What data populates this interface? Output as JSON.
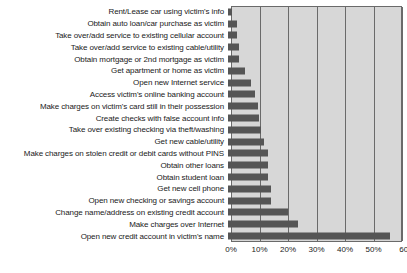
{
  "chart_data": {
    "type": "bar",
    "orientation": "horizontal",
    "title": "",
    "subtitle": "",
    "xlabel": "",
    "ylabel": "",
    "xlim": [
      0,
      60
    ],
    "grid": true,
    "legend": null,
    "bar_color": "#555555",
    "plot_background": "#d7d7d7",
    "axis_color": "#6a6a6a",
    "tick_labels": [
      "0%",
      "10%",
      "20%",
      "30%",
      "40%",
      "50%",
      "60"
    ],
    "tick_values": [
      0,
      10,
      20,
      30,
      40,
      50,
      60
    ],
    "categories": [
      "Rent/Lease car using victim's info",
      "Obtain auto loan/car purchase as victim",
      "Take over/add service to existing cellular account",
      "Take over/add service to existing cable/utility",
      "Obtain mortgage or 2nd mortgage as victim",
      "Get apartment or home as victim",
      "Open new Internet service",
      "Access victim's online banking account",
      "Make charges on victim's card still in their possession",
      "Create checks with false account info",
      "Take over existing checking via theft/washing",
      "Get new cable/utility",
      "Make charges on stolen credit or debit cards without PINS",
      "Obtain other loans",
      "Obtain student loan",
      "Get new cell phone",
      "Open new checking or savings account",
      "Change name/address on existing credit account",
      "Make charges over Internet",
      "Open new credit account in victim's name"
    ],
    "values": [
      1.5,
      3,
      3,
      4,
      4,
      6,
      8,
      9.5,
      10.5,
      11,
      11.5,
      12.5,
      14,
      14,
      14,
      15,
      15,
      21,
      24.5,
      57
    ]
  }
}
